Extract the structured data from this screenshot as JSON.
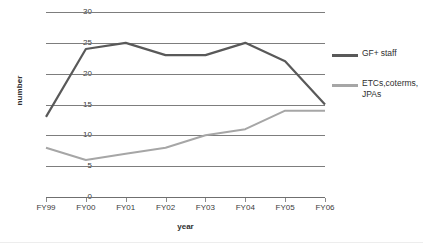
{
  "chart_data": {
    "type": "line",
    "title": "",
    "xlabel": "year",
    "ylabel": "number",
    "categories": [
      "FY99",
      "FY00",
      "FY01",
      "FY02",
      "FY03",
      "FY04",
      "FY05",
      "FY06"
    ],
    "ylim": [
      0,
      30
    ],
    "yticks": [
      0,
      5,
      10,
      15,
      20,
      25,
      30
    ],
    "grid": true,
    "legend_position": "right",
    "series": [
      {
        "name": "GF+ staff",
        "color": "#595959",
        "values": [
          13,
          24,
          25,
          23,
          23,
          25,
          22,
          15
        ]
      },
      {
        "name": "ETCs,coterms, JPAs",
        "name_lines": [
          "ETCs,coterms,",
          "JPAs"
        ],
        "color": "#a6a6a6",
        "values": [
          8,
          6,
          7,
          8,
          10,
          11,
          14,
          14
        ]
      }
    ]
  },
  "axes": {
    "x_title": "year",
    "y_title": "number"
  },
  "legend": {
    "items": [
      {
        "label_line1": "GF+ staff",
        "label_line2": ""
      },
      {
        "label_line1": "ETCs,coterms,",
        "label_line2": "JPAs"
      }
    ]
  }
}
